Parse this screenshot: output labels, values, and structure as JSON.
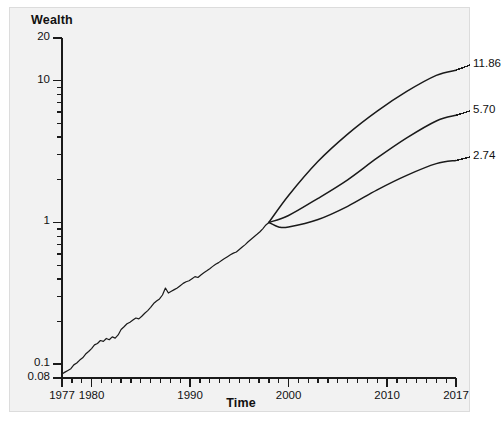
{
  "figure": {
    "background_color": "#f2f2f2",
    "page_color": "#ffffff",
    "border_color": "#dcdcdc",
    "line_color": "#1a1a1a"
  },
  "chart_data": {
    "type": "line",
    "title": "",
    "subtitle": "",
    "xlabel": "Time",
    "ylabel": "Wealth",
    "yscale": "log",
    "xscale": "linear",
    "grid": false,
    "legend": null,
    "xlim": [
      1977,
      2017
    ],
    "ylim": [
      0.08,
      20
    ],
    "ytick_labels": [
      "20",
      "10",
      "1",
      "0.1",
      "0.08"
    ],
    "ytick_values": [
      20,
      10,
      1,
      0.1,
      0.08
    ],
    "yminor_ticks": [
      9,
      8,
      7,
      6,
      5,
      4,
      3,
      2,
      0.9,
      0.8,
      0.7,
      0.6,
      0.5,
      0.4,
      0.3,
      0.2
    ],
    "xtick_labels": [
      "1977",
      "1980",
      "1990",
      "2000",
      "2010",
      "2017"
    ],
    "xtick_values": [
      1977,
      1980,
      1990,
      2000,
      2010,
      2017
    ],
    "xminor_tick_interval": 1,
    "annotations": [
      {
        "name": "upper-projection-endpoint",
        "text": "11.86",
        "x": 2017,
        "y": 11.86
      },
      {
        "name": "middle-projection-endpoint",
        "text": "5.70",
        "x": 2017,
        "y": 5.7
      },
      {
        "name": "lower-projection-endpoint",
        "text": "2.74",
        "x": 2017,
        "y": 2.74
      }
    ],
    "series": [
      {
        "name": "historical-wealth",
        "style": "solid",
        "x": [
          1977.0,
          1977.3,
          1977.6,
          1977.9,
          1978.2,
          1978.5,
          1978.8,
          1979.1,
          1979.4,
          1979.7,
          1980.0,
          1980.3,
          1980.6,
          1980.9,
          1981.2,
          1981.5,
          1981.8,
          1982.1,
          1982.4,
          1982.7,
          1983.0,
          1983.3,
          1983.6,
          1983.9,
          1984.2,
          1984.5,
          1984.8,
          1985.1,
          1985.4,
          1985.7,
          1986.0,
          1986.3,
          1986.6,
          1986.9,
          1987.2,
          1987.5,
          1987.8,
          1988.1,
          1988.4,
          1988.7,
          1989.0,
          1989.3,
          1989.6,
          1989.9,
          1990.2,
          1990.5,
          1990.8,
          1991.1,
          1991.4,
          1991.7,
          1992.0,
          1992.3,
          1992.6,
          1992.9,
          1993.2,
          1993.5,
          1993.8,
          1994.1,
          1994.4,
          1994.7,
          1995.0,
          1995.3,
          1995.6,
          1995.9,
          1996.2,
          1996.5,
          1996.8,
          1997.1,
          1997.4,
          1997.7,
          1998.0
        ],
        "y": [
          0.0855,
          0.088,
          0.0905,
          0.093,
          0.099,
          0.102,
          0.107,
          0.111,
          0.118,
          0.123,
          0.129,
          0.137,
          0.14,
          0.147,
          0.145,
          0.152,
          0.149,
          0.156,
          0.153,
          0.161,
          0.176,
          0.184,
          0.193,
          0.198,
          0.205,
          0.212,
          0.209,
          0.218,
          0.229,
          0.239,
          0.252,
          0.268,
          0.279,
          0.289,
          0.308,
          0.345,
          0.318,
          0.327,
          0.336,
          0.345,
          0.358,
          0.372,
          0.382,
          0.388,
          0.401,
          0.415,
          0.409,
          0.426,
          0.442,
          0.456,
          0.472,
          0.49,
          0.508,
          0.521,
          0.539,
          0.556,
          0.574,
          0.592,
          0.608,
          0.619,
          0.645,
          0.672,
          0.698,
          0.731,
          0.762,
          0.794,
          0.825,
          0.86,
          0.905,
          0.96,
          1.0
        ]
      },
      {
        "name": "upper-projection",
        "style": "solid",
        "x": [
          1998,
          2000,
          2003,
          2006,
          2009,
          2012,
          2015,
          2017
        ],
        "y": [
          1.0,
          1.55,
          2.7,
          4.2,
          6.1,
          8.4,
          10.9,
          11.86
        ]
      },
      {
        "name": "middle-projection",
        "style": "solid",
        "x": [
          1998,
          2000,
          2003,
          2006,
          2009,
          2012,
          2015,
          2017
        ],
        "y": [
          1.0,
          1.12,
          1.48,
          2.0,
          2.85,
          3.95,
          5.2,
          5.7
        ]
      },
      {
        "name": "lower-projection",
        "style": "solid",
        "x": [
          1998,
          1999,
          2000,
          2003,
          2006,
          2009,
          2012,
          2015,
          2017
        ],
        "y": [
          1.0,
          0.93,
          0.93,
          1.05,
          1.3,
          1.7,
          2.15,
          2.6,
          2.74
        ]
      }
    ]
  }
}
